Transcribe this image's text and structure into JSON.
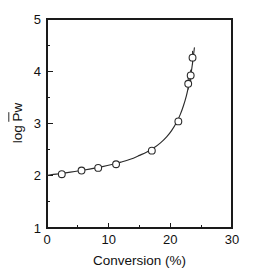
{
  "chart_data": {
    "type": "scatter",
    "title": "",
    "subtitle": "",
    "xlabel": "Conversion (%)",
    "ylabel": "log Pw",
    "ylabel_parts": {
      "prefix": "log ",
      "overlined": "P",
      "subscript_like": "w"
    },
    "xlim": [
      0,
      30
    ],
    "ylim": [
      1,
      5
    ],
    "xticks": [
      0,
      10,
      20,
      30
    ],
    "xticklabels": [
      "0",
      "10",
      "20",
      "30"
    ],
    "yticks": [
      1,
      2,
      3,
      4,
      5
    ],
    "yticklabels": [
      "1",
      "2",
      "3",
      "4",
      "5"
    ],
    "xminorticks": [
      5,
      15,
      25
    ],
    "yminorticks": [
      1.5,
      2.5,
      3.5,
      4.5
    ],
    "grid": false,
    "legend": null,
    "legend_position": "none",
    "marker_style": "open-circle",
    "series": [
      {
        "name": "log Pw vs conversion",
        "x": [
          2.4,
          5.6,
          8.3,
          11.2,
          17.0,
          21.3,
          22.9,
          23.3,
          23.6
        ],
        "y": [
          2.03,
          2.1,
          2.15,
          2.22,
          2.48,
          3.04,
          3.76,
          3.92,
          4.26
        ],
        "errorbars_y": [
          0,
          0,
          0,
          0,
          0,
          0,
          0.11,
          0.11,
          0.13
        ],
        "has_fit_curve": true
      }
    ],
    "fit_curve": {
      "name": "fitted curve",
      "x": [
        0.0,
        1.5,
        3.0,
        4.5,
        6.0,
        7.5,
        9.0,
        10.5,
        12.0,
        13.5,
        15.0,
        16.2,
        17.4,
        18.4,
        19.4,
        20.2,
        21.0,
        21.6,
        22.1,
        22.6,
        23.0,
        23.35,
        23.65,
        23.9
      ],
      "y": [
        2.01,
        2.03,
        2.055,
        2.082,
        2.11,
        2.14,
        2.175,
        2.215,
        2.26,
        2.315,
        2.39,
        2.455,
        2.54,
        2.63,
        2.745,
        2.865,
        3.02,
        3.17,
        3.33,
        3.53,
        3.74,
        3.95,
        4.2,
        4.45
      ]
    },
    "colors": {
      "axis": "#1a1a1a",
      "curve": "#2b2b2b",
      "marker_face": "#ffffff",
      "marker_edge": "#2b2b2b",
      "background": "#ffffff"
    }
  },
  "figure": {
    "name": "log-pw-vs-conversion-plot"
  }
}
